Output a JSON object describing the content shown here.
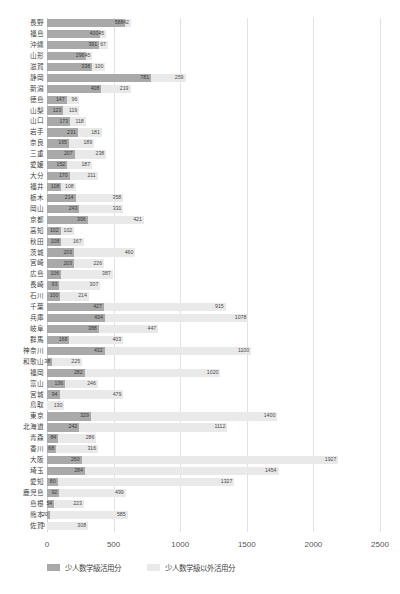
{
  "chart_data": {
    "type": "bar",
    "orientation": "horizontal",
    "stacked": true,
    "title": "",
    "xlabel": "",
    "ylabel": "",
    "xlim": [
      0,
      2500
    ],
    "xticks": [
      "0",
      "500",
      "1000",
      "1500",
      "2000",
      "2500"
    ],
    "grid": true,
    "legend_position": "bottom-left",
    "series": [
      {
        "name": "少人数学級活用分",
        "color": "#a9a9a9"
      },
      {
        "name": "少人数学級以外活用分",
        "color": "#e9e9e9"
      }
    ],
    "categories": [
      "長野",
      "福島",
      "沖縄",
      "山形",
      "滋賀",
      "静岡",
      "新潟",
      "徳島",
      "山梨",
      "山口",
      "岩手",
      "奈良",
      "三重",
      "愛媛",
      "大分",
      "福井",
      "栃木",
      "岡山",
      "京都",
      "高知",
      "秋田",
      "茨城",
      "宮崎",
      "広島",
      "長崎",
      "石川",
      "千葉",
      "兵庫",
      "岐阜",
      "群馬",
      "神奈川",
      "和歌山",
      "福岡",
      "富山",
      "宮城",
      "鳥取",
      "東京",
      "北海道",
      "青森",
      "香川",
      "大阪",
      "埼玉",
      "愛知",
      "鹿児島",
      "島根",
      "熊本",
      "佐賀"
    ],
    "values_series_0": [
      588,
      400,
      391,
      296,
      338,
      781,
      408,
      147,
      123,
      173,
      231,
      165,
      207,
      152,
      170,
      108,
      214,
      243,
      306,
      102,
      108,
      203,
      203,
      106,
      93,
      100,
      427,
      434,
      388,
      168,
      432,
      38,
      282,
      136,
      94,
      0,
      329,
      242,
      84,
      68,
      260,
      284,
      80,
      92,
      54,
      20,
      0
    ],
    "values_series_1": [
      42,
      45,
      67,
      45,
      100,
      259,
      219,
      96,
      119,
      118,
      181,
      189,
      238,
      187,
      211,
      108,
      358,
      331,
      421,
      102,
      167,
      460,
      226,
      387,
      307,
      214,
      915,
      1078,
      447,
      403,
      1100,
      225,
      1020,
      246,
      479,
      130,
      1400,
      1112,
      286,
      316,
      1927,
      1454,
      1327,
      499,
      223,
      585,
      308
    ],
    "labels_series_0": [
      "588",
      "400",
      "391",
      "296",
      "338",
      "781",
      "408",
      "147",
      "123",
      "173",
      "231",
      "165",
      "207",
      "152",
      "170",
      "108",
      "214",
      "243",
      "306",
      "102",
      "108",
      "203",
      "203",
      "106",
      "93",
      "100",
      "427",
      "434",
      "388",
      "168",
      "432",
      "38",
      "282",
      "136",
      "94",
      "",
      "329",
      "242",
      "84",
      "68",
      "260",
      "284",
      "80",
      "92",
      "54",
      "20",
      "0"
    ],
    "labels_series_1": [
      "42",
      "45",
      "67",
      "45",
      "100",
      "259",
      "219",
      "96",
      "119",
      "118",
      "181",
      "189",
      "238",
      "187",
      "211",
      "108",
      "358",
      "331",
      "421",
      "102",
      "167",
      "460",
      "226",
      "387",
      "307",
      "214",
      "915",
      "1078",
      "447",
      "403",
      "1100",
      "225",
      "1020",
      "246",
      "479",
      "130",
      "1400",
      "1112",
      "286",
      "316",
      "1927",
      "1454",
      "1327",
      "499",
      "223",
      "585",
      "308"
    ]
  }
}
